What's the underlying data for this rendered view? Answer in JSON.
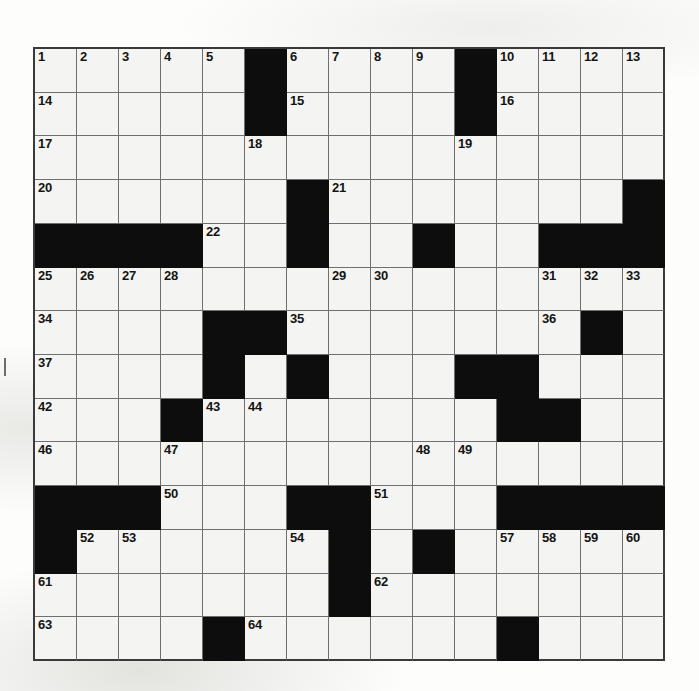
{
  "puzzle": {
    "title": "Crossword Puzzle Grid",
    "kind": "crossword-grid",
    "columns": 15,
    "rows": 14,
    "highest_clue_number": 68,
    "colors": {
      "block": "#0d0d0d",
      "open_cell": "#f4f4f2",
      "grid_line": "#6f6f6f",
      "border": "#3a3a3a",
      "number_text": "#141414"
    },
    "legend": {
      "block_symbol": "#",
      "open_symbol": ".",
      "description": "Black squares separate entries; numbers mark the start of Across and Down answers."
    },
    "grid_rows": [
      ".....#....#....",
      ".....#....#....",
      "...............",
      "......#.......#",
      "####..#..#..###",
      "...............",
      "....##.......#.",
      "....#.#...##...",
      "...#.......##..",
      "...............",
      "###...##...####",
      "#......#.#.....",
      ".......#.......",
      "....#......#..."
    ],
    "numbers": [
      {
        "n": 1,
        "row": 1,
        "col": 1
      },
      {
        "n": 2,
        "row": 1,
        "col": 2
      },
      {
        "n": 3,
        "row": 1,
        "col": 3
      },
      {
        "n": 4,
        "row": 1,
        "col": 4
      },
      {
        "n": 5,
        "row": 1,
        "col": 5
      },
      {
        "n": 6,
        "row": 1,
        "col": 7
      },
      {
        "n": 7,
        "row": 1,
        "col": 8
      },
      {
        "n": 8,
        "row": 1,
        "col": 9
      },
      {
        "n": 9,
        "row": 1,
        "col": 10
      },
      {
        "n": 10,
        "row": 1,
        "col": 12
      },
      {
        "n": 11,
        "row": 1,
        "col": 13
      },
      {
        "n": 12,
        "row": 1,
        "col": 14
      },
      {
        "n": 13,
        "row": 1,
        "col": 15
      },
      {
        "n": 14,
        "row": 2,
        "col": 1
      },
      {
        "n": 15,
        "row": 2,
        "col": 7
      },
      {
        "n": 16,
        "row": 2,
        "col": 12
      },
      {
        "n": 17,
        "row": 3,
        "col": 1
      },
      {
        "n": 18,
        "row": 3,
        "col": 6
      },
      {
        "n": 19,
        "row": 3,
        "col": 11
      },
      {
        "n": 20,
        "row": 4,
        "col": 1
      },
      {
        "n": 21,
        "row": 4,
        "col": 8
      },
      {
        "n": 22,
        "row": 5,
        "col": 5
      },
      {
        "n": 23,
        "row": 5,
        "col": 7
      },
      {
        "n": 24,
        "row": 5,
        "col": 10
      },
      {
        "n": 25,
        "row": 6,
        "col": 1
      },
      {
        "n": 26,
        "row": 6,
        "col": 2
      },
      {
        "n": 27,
        "row": 6,
        "col": 3
      },
      {
        "n": 28,
        "row": 6,
        "col": 4
      },
      {
        "n": 29,
        "row": 6,
        "col": 8
      },
      {
        "n": 30,
        "row": 6,
        "col": 9
      },
      {
        "n": 31,
        "row": 6,
        "col": 13
      },
      {
        "n": 32,
        "row": 6,
        "col": 14
      },
      {
        "n": 33,
        "row": 6,
        "col": 15
      },
      {
        "n": 34,
        "row": 7,
        "col": 1
      },
      {
        "n": 35,
        "row": 7,
        "col": 7
      },
      {
        "n": 36,
        "row": 7,
        "col": 13
      },
      {
        "n": 37,
        "row": 8,
        "col": 1
      },
      {
        "n": 38,
        "row": 8,
        "col": 5
      },
      {
        "n": 39,
        "row": 8,
        "col": 7
      },
      {
        "n": 40,
        "row": 8,
        "col": 11
      },
      {
        "n": 41,
        "row": 8,
        "col": 12
      },
      {
        "n": 42,
        "row": 9,
        "col": 1
      },
      {
        "n": 43,
        "row": 9,
        "col": 5
      },
      {
        "n": 44,
        "row": 9,
        "col": 6
      },
      {
        "n": 45,
        "row": 9,
        "col": 12
      },
      {
        "n": 46,
        "row": 10,
        "col": 1
      },
      {
        "n": 47,
        "row": 10,
        "col": 4
      },
      {
        "n": 48,
        "row": 10,
        "col": 10
      },
      {
        "n": 49,
        "row": 10,
        "col": 11
      },
      {
        "n": 50,
        "row": 11,
        "col": 4
      },
      {
        "n": 51,
        "row": 11,
        "col": 9
      },
      {
        "n": 52,
        "row": 12,
        "col": 2
      },
      {
        "n": 53,
        "row": 12,
        "col": 3
      },
      {
        "n": 54,
        "row": 12,
        "col": 7
      },
      {
        "n": 55,
        "row": 12,
        "col": 8
      },
      {
        "n": 56,
        "row": 12,
        "col": 10
      },
      {
        "n": 57,
        "row": 12,
        "col": 12
      },
      {
        "n": 58,
        "row": 12,
        "col": 13
      },
      {
        "n": 59,
        "row": 12,
        "col": 14
      },
      {
        "n": 60,
        "row": 12,
        "col": 15
      },
      {
        "n": 61,
        "row": 13,
        "col": 1
      },
      {
        "n": 62,
        "row": 13,
        "col": 9
      },
      {
        "n": 63,
        "row": 14,
        "col": 1
      },
      {
        "n": 64,
        "row": 14,
        "col": 6
      },
      {
        "n": 65,
        "row": 14,
        "col": 12
      },
      {
        "n": 66,
        "row": 15,
        "col": 1
      },
      {
        "n": 67,
        "row": 15,
        "col": 6
      },
      {
        "n": 68,
        "row": 15,
        "col": 12
      }
    ]
  }
}
